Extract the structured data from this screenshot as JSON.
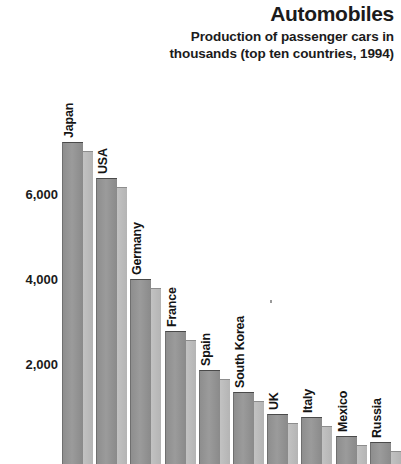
{
  "header": {
    "title": "Automobiles",
    "subtitle": "Production of passenger cars in thousands (top ten countries, 1994)"
  },
  "chart_data": {
    "type": "bar",
    "title": "Automobiles",
    "subtitle": "Production of passenger cars in thousands (top ten countries, 1994)",
    "xlabel": "",
    "ylabel": "",
    "ylim": [
      0,
      8000
    ],
    "grid": false,
    "legend": null,
    "yticks": [
      "2,000",
      "4,000",
      "6,000"
    ],
    "ytick_values": [
      2000,
      4000,
      6000
    ],
    "categories": [
      "Japan",
      "USA",
      "Germany",
      "France",
      "Spain",
      "South Korea",
      "UK",
      "Italy",
      "Mexico",
      "Russia"
    ],
    "values": [
      7300,
      6450,
      4070,
      2850,
      1930,
      1410,
      890,
      830,
      375,
      230
    ],
    "units": "thousands of cars",
    "year": 1994
  }
}
